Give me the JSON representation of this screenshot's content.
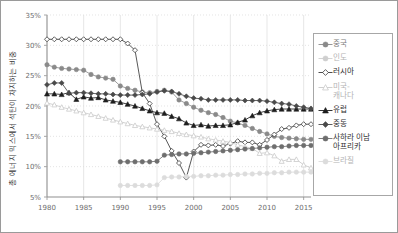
{
  "axes": {
    "ylabel": "총 에너지 믹스에서 석탄이 차지하는 비중",
    "xlabel": "",
    "yticks": [
      "5%",
      "10%",
      "15%",
      "20%",
      "25%",
      "30%",
      "35%"
    ],
    "xticks": [
      "1980",
      "1985",
      "1990",
      "1995",
      "2000",
      "2005",
      "2010",
      "2015"
    ]
  },
  "legend": {
    "items": [
      {
        "label": "중국",
        "marker": "circle",
        "color": "#8a8a8a"
      },
      {
        "label": "인도",
        "marker": "circle",
        "color": "#cfcfcf"
      },
      {
        "label": "러시아",
        "marker": "diamond-open",
        "color": "#3a3a3a"
      },
      {
        "label": "미국-\n캐나다",
        "marker": "triangle-open",
        "color": "#cacaca"
      },
      {
        "label": "유럽",
        "marker": "triangle",
        "color": "#1e1e1e"
      },
      {
        "label": "중동",
        "marker": "diamond",
        "color": "#4a4a4a"
      },
      {
        "label": "사하라 이남\n아프리카",
        "marker": "circle",
        "color": "#6e6e6e"
      },
      {
        "label": "브라질",
        "marker": "circle",
        "color": "#dcdcdc"
      }
    ]
  },
  "chart_data": {
    "type": "line",
    "title": "",
    "xlabel": "",
    "ylabel": "총 에너지 믹스에서 석탄이 차지하는 비중",
    "xlim": [
      1980,
      2016
    ],
    "ylim": [
      5,
      35
    ],
    "grid": true,
    "legend_position": "right",
    "x": [
      1980,
      1981,
      1982,
      1983,
      1984,
      1985,
      1986,
      1987,
      1988,
      1989,
      1990,
      1991,
      1992,
      1993,
      1994,
      1995,
      1996,
      1997,
      1998,
      1999,
      2000,
      2001,
      2002,
      2003,
      2004,
      2005,
      2006,
      2007,
      2008,
      2009,
      2010,
      2011,
      2012,
      2013,
      2014,
      2015,
      2016
    ],
    "series": [
      {
        "name": "중국",
        "marker": "circle",
        "color": "#8a8a8a",
        "values": [
          26.8,
          26.4,
          26.2,
          26.1,
          26.0,
          25.9,
          25.2,
          24.8,
          24.6,
          24.4,
          23.3,
          22.9,
          22.6,
          22.3,
          22.2,
          22.4,
          22.6,
          22.3,
          21.0,
          20.4,
          19.8,
          19.3,
          18.9,
          18.6,
          18.1,
          17.5,
          17.2,
          16.8,
          16.3,
          15.8,
          15.4,
          15.0,
          14.8,
          14.7,
          14.6,
          14.5,
          14.5
        ]
      },
      {
        "name": "인도",
        "marker": "circle",
        "color": "#cfcfcf",
        "values": [
          null,
          null,
          null,
          null,
          null,
          null,
          null,
          null,
          null,
          null,
          null,
          null,
          null,
          null,
          null,
          null,
          null,
          null,
          null,
          null,
          null,
          null,
          null,
          null,
          null,
          null,
          null,
          null,
          null,
          null,
          null,
          null,
          null,
          null,
          null,
          null,
          null
        ]
      },
      {
        "name": "러시아",
        "marker": "diamond-open",
        "color": "#3a3a3a",
        "values": [
          31.0,
          31.0,
          31.0,
          31.0,
          31.0,
          31.0,
          31.0,
          31.0,
          31.0,
          31.0,
          31.0,
          30.3,
          29.2,
          22.2,
          20.4,
          17.0,
          15.0,
          12.6,
          10.6,
          8.2,
          12.5,
          13.6,
          13.5,
          13.6,
          13.4,
          13.8,
          14.2,
          14.0,
          14.0,
          13.6,
          14.4,
          15.3,
          16.2,
          16.4,
          16.8,
          17.0,
          17.0
        ]
      },
      {
        "name": "미국-캐나다",
        "marker": "triangle-open",
        "color": "#cacaca",
        "values": [
          20.5,
          20.2,
          19.8,
          19.5,
          19.2,
          18.9,
          18.6,
          18.3,
          18.0,
          17.7,
          17.4,
          17.1,
          16.8,
          16.6,
          16.4,
          16.2,
          16.0,
          15.8,
          15.5,
          15.3,
          15.1,
          14.9,
          14.6,
          14.4,
          14.2,
          14.0,
          13.6,
          13.3,
          13.0,
          12.2,
          12.3,
          11.8,
          10.9,
          11.2,
          11.2,
          10.3,
          9.8
        ]
      },
      {
        "name": "유럽",
        "marker": "triangle",
        "color": "#1e1e1e",
        "values": [
          22.0,
          22.0,
          21.9,
          22.2,
          21.1,
          21.5,
          21.3,
          21.4,
          21.0,
          20.8,
          20.6,
          20.3,
          20.0,
          19.6,
          19.2,
          18.9,
          18.8,
          18.3,
          17.9,
          17.2,
          16.8,
          16.9,
          16.7,
          16.8,
          16.8,
          16.9,
          17.3,
          17.7,
          18.4,
          18.9,
          19.2,
          19.4,
          19.5,
          19.5,
          19.5,
          19.5,
          19.5
        ]
      },
      {
        "name": "중동",
        "marker": "diamond",
        "color": "#4a4a4a",
        "values": [
          23.5,
          23.8,
          23.8,
          22.1,
          22.2,
          22.2,
          22.1,
          22.0,
          22.0,
          21.9,
          21.8,
          21.8,
          21.8,
          21.9,
          22.0,
          22.3,
          22.5,
          22.4,
          22.0,
          21.6,
          21.3,
          21.2,
          21.0,
          21.0,
          21.0,
          21.0,
          21.0,
          20.9,
          20.9,
          20.9,
          20.8,
          20.6,
          20.4,
          20.3,
          20.0,
          19.8,
          19.6
        ]
      },
      {
        "name": "사하라 이남 아프리카",
        "marker": "circle",
        "color": "#6e6e6e",
        "values": [
          null,
          null,
          null,
          null,
          null,
          null,
          null,
          null,
          null,
          null,
          10.8,
          10.8,
          10.8,
          10.8,
          10.8,
          10.9,
          11.9,
          12.0,
          12.1,
          12.1,
          12.2,
          12.3,
          12.4,
          12.5,
          12.6,
          12.7,
          12.8,
          12.9,
          13.0,
          13.1,
          13.2,
          13.3,
          13.3,
          13.4,
          13.5,
          13.5,
          13.5
        ]
      },
      {
        "name": "브라질",
        "marker": "circle",
        "color": "#dcdcdc",
        "values": [
          null,
          null,
          null,
          null,
          null,
          null,
          null,
          null,
          null,
          null,
          6.9,
          6.9,
          6.9,
          6.9,
          6.9,
          7.0,
          8.2,
          8.3,
          8.3,
          8.4,
          8.4,
          8.5,
          8.5,
          8.6,
          8.6,
          8.7,
          8.7,
          8.8,
          8.8,
          8.9,
          8.9,
          9.0,
          9.0,
          9.1,
          9.1,
          9.1,
          9.1
        ]
      }
    ]
  }
}
